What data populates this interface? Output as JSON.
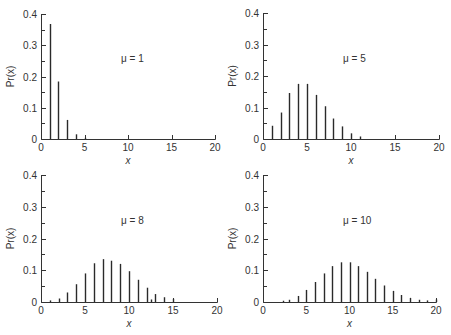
{
  "chart_data": [
    {
      "type": "bar",
      "title": "μ = 1",
      "mu_label": "μ = 1",
      "xlabel": "x",
      "ylabel": "Pr(x)",
      "xlim": [
        0,
        20
      ],
      "ylim": [
        0,
        0.4
      ],
      "xticks": [
        0,
        5,
        10,
        15,
        20
      ],
      "yticks": [
        0,
        0.1,
        0.2,
        0.3,
        0.4
      ],
      "ytick_labels": [
        "0",
        "0.1",
        "0.2",
        "0.3",
        "0.4"
      ],
      "x": [
        1,
        2,
        3,
        4,
        5
      ],
      "values": [
        0.368,
        0.184,
        0.061,
        0.015,
        0.004
      ],
      "grid": false,
      "panel": {
        "x0": 41,
        "x20": 215,
        "y0": 139,
        "ytop": 14
      }
    },
    {
      "type": "bar",
      "title": "μ = 5",
      "mu_label": "μ = 5",
      "xlabel": "x",
      "ylabel": "Pr(x)",
      "xlim": [
        0,
        20
      ],
      "ylim": [
        0,
        0.4
      ],
      "xticks": [
        0,
        5,
        10,
        15,
        20
      ],
      "yticks": [
        0,
        0.1,
        0.2,
        0.3,
        0.4
      ],
      "ytick_labels": [
        "0",
        "0.1",
        "0.2",
        "0.3",
        "0.4"
      ],
      "x": [
        1,
        2,
        3,
        4,
        5,
        6,
        7,
        8,
        9,
        10,
        11
      ],
      "values": [
        0.042,
        0.084,
        0.146,
        0.175,
        0.175,
        0.14,
        0.104,
        0.065,
        0.04,
        0.018,
        0.008
      ],
      "grid": false,
      "panel": {
        "x0": 263,
        "x20": 439,
        "y0": 139,
        "ytop": 13
      }
    },
    {
      "type": "bar",
      "title": "μ = 8",
      "mu_label": "μ = 8",
      "xlabel": "x",
      "ylabel": "Pr(x)",
      "xlim": [
        0,
        20
      ],
      "ylim": [
        0,
        0.4
      ],
      "xticks": [
        0,
        5,
        10,
        15,
        20
      ],
      "yticks": [
        0,
        0.1,
        0.2,
        0.3,
        0.4
      ],
      "ytick_labels": [
        "0",
        "0.1",
        "0.2",
        "0.3",
        "0.4"
      ],
      "x": [
        1,
        2,
        3,
        4,
        5,
        6,
        7,
        8,
        9,
        10,
        11,
        12,
        12.5,
        13,
        14,
        15
      ],
      "values": [
        0.005,
        0.011,
        0.03,
        0.056,
        0.09,
        0.122,
        0.135,
        0.13,
        0.12,
        0.097,
        0.07,
        0.045,
        0.008,
        0.025,
        0.015,
        0.01
      ],
      "grid": false,
      "panel": {
        "x0": 41,
        "x20": 217,
        "y0": 302,
        "ytop": 175
      }
    },
    {
      "type": "bar",
      "title": "μ = 10",
      "mu_label": "μ = 10",
      "xlabel": "x",
      "ylabel": "Pr(x)",
      "xlim": [
        0,
        20
      ],
      "ylim": [
        0,
        0.4
      ],
      "xticks": [
        0,
        5,
        10,
        15,
        20
      ],
      "yticks": [
        0,
        0.1,
        0.2,
        0.3,
        0.4
      ],
      "ytick_labels": [
        "0",
        "0.1",
        "0.2",
        "0.3",
        "0.4"
      ],
      "x": [
        2.3,
        3,
        4,
        5,
        6,
        7,
        8,
        9,
        10,
        11,
        12,
        13,
        14,
        15,
        16,
        17,
        18,
        19,
        20
      ],
      "values": [
        0.004,
        0.007,
        0.019,
        0.038,
        0.063,
        0.09,
        0.113,
        0.125,
        0.125,
        0.113,
        0.095,
        0.073,
        0.052,
        0.035,
        0.022,
        0.013,
        0.007,
        0.005,
        0.008
      ],
      "grid": false,
      "panel": {
        "x0": 263,
        "x20": 436,
        "y0": 302,
        "ytop": 175
      }
    }
  ]
}
